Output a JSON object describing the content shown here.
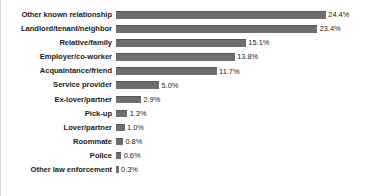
{
  "chart_data": {
    "type": "bar",
    "orientation": "horizontal",
    "title": "",
    "subtitle": "",
    "xlabel": "",
    "ylabel": "",
    "grid": false,
    "legend": false,
    "axis_visible": false,
    "value_suffix": "%",
    "xlim": [
      0,
      24.4
    ],
    "px_per_unit": 8.6,
    "bar_color": "#6f6d6d",
    "bar_edge_color": "#585757",
    "label_color": "#1b1b1b",
    "background": "#ffffff",
    "categories": [
      "Other known relationship",
      "Landlord/tenant/neighbor",
      "Relative/family",
      "Employer/co-worker",
      "Acquaintance/friend",
      "Service provider",
      "Ex-lover/partner",
      "Pick-up",
      "Lover/partner",
      "Roommate",
      "Police",
      "Other law enforcement"
    ],
    "values": [
      24.4,
      23.4,
      15.1,
      13.8,
      11.7,
      5.0,
      2.9,
      1.3,
      1.0,
      0.8,
      0.6,
      0.3
    ],
    "value_labels": [
      "24.4%",
      "23.4%",
      "15.1%",
      "13.8%",
      "11.7%",
      "5.0%",
      "2.9%",
      "1.3%",
      "1.0%",
      "0.8%",
      "0.6%",
      "0.3%"
    ]
  }
}
